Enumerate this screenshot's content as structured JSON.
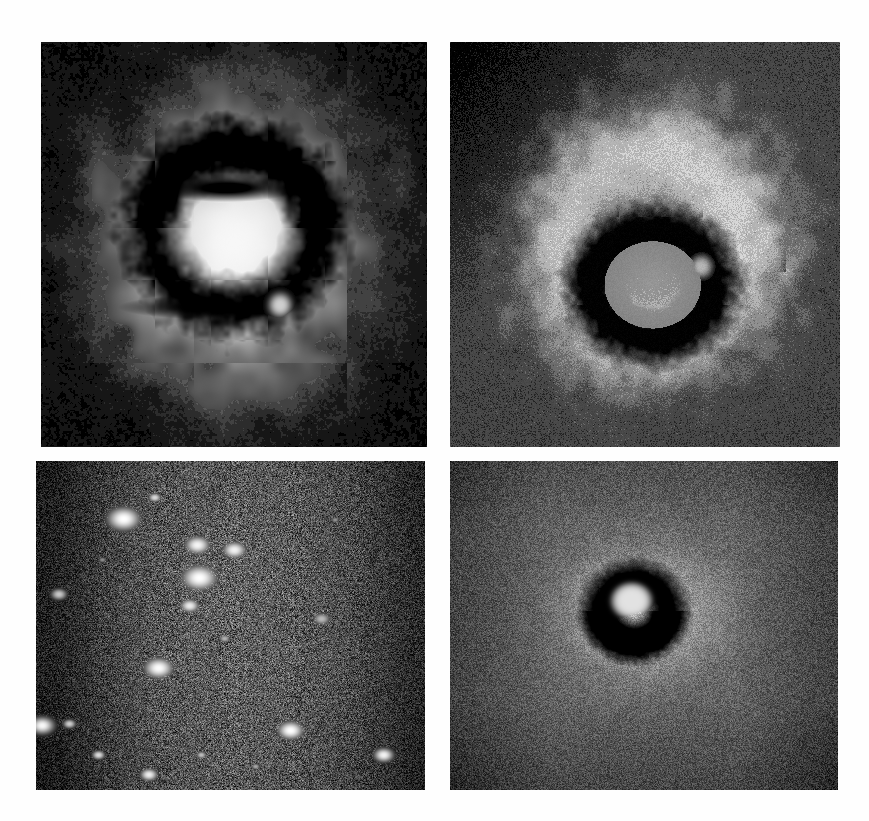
{
  "figure": {
    "kind": "astronomical-image-grid",
    "title": "",
    "background_color": "#fefefe",
    "width": 869,
    "height": 821,
    "columns": 2,
    "rows": 2,
    "has_text_labels": false,
    "has_axes": false,
    "colormap": "grayscale"
  },
  "panels": [
    {
      "id": "panel-top-left",
      "position": "top-left",
      "label": "",
      "x": 41,
      "y": 42,
      "width": 386,
      "height": 405,
      "render": "halo-nebula",
      "background_color": "#060606",
      "description": "Bright diffuse nebular halo with an irregular dark ring/bar structure near the centre and a small bright knot on the lower right of the ring",
      "levels": [
        "#050505",
        "#1d1d1d",
        "#3a3a3a",
        "#5e5e5e",
        "#8a8a8a",
        "#b6b6b6",
        "#d2d2d2"
      ],
      "halo": {
        "cx": 0.5,
        "cy": 0.5,
        "rx": 0.4,
        "ry": 0.4,
        "peak": "#d4d4d4"
      },
      "dark_ring": {
        "cx": 0.5,
        "cy": 0.46,
        "rx": 0.22,
        "ry": 0.2,
        "thickness": 0.055,
        "color": "#040404"
      },
      "inner_bar": {
        "cx": 0.48,
        "cy": 0.36,
        "rx": 0.14,
        "ry": 0.035,
        "color": "#040404"
      },
      "bright_knot": {
        "cx": 0.62,
        "cy": 0.65,
        "r": 0.03,
        "color": "#cfcfcf"
      },
      "noise_amount": 0.035
    },
    {
      "id": "panel-top-right",
      "position": "top-right",
      "label": "",
      "x": 450,
      "y": 42,
      "width": 390,
      "height": 405,
      "render": "contour-nebula",
      "background_color": "#4d4d4d",
      "description": "Posterised / contoured version of the same nebula showing concentric grey intensity bands, a light-grey annular shell, a black inner ring and a noisy speckled background that is darkest toward the upper left",
      "levels": [
        "#0a0a0a",
        "#3c3c3c",
        "#5a5a5a",
        "#7c7c7c",
        "#9e9e9e",
        "#bcbcbc",
        "#d6d6d6"
      ],
      "shell": {
        "cx": 0.52,
        "cy": 0.5,
        "r_outer": 0.37,
        "r_inner": 0.17,
        "color": "#b8b8b8"
      },
      "dark_ring": {
        "cx": 0.52,
        "cy": 0.6,
        "rx": 0.155,
        "ry": 0.135,
        "thickness": 0.05,
        "color": "#060606"
      },
      "bright_knot": {
        "cx": 0.645,
        "cy": 0.555,
        "r": 0.028,
        "color": "#b4b4b4"
      },
      "noise_amount": 0.3,
      "posterize_levels": 6
    },
    {
      "id": "panel-bottom-left",
      "position": "bottom-left",
      "label": "",
      "x": 36,
      "y": 461,
      "width": 389,
      "height": 329,
      "render": "star-field",
      "background_color": "#101010",
      "description": "Crowded star field; speckled dark background brightening toward the centre-right with numerous bright white point sources",
      "levels": [
        "#050505",
        "#1a1a1a",
        "#2e2e2e",
        "#4a4a4a",
        "#6a6a6a",
        "#f2f2f2"
      ],
      "noise_amount": 0.85,
      "stars": [
        {
          "cx": 0.225,
          "cy": 0.175,
          "r": 0.042,
          "brightness": 1.0
        },
        {
          "cx": 0.415,
          "cy": 0.255,
          "r": 0.032,
          "brightness": 0.96
        },
        {
          "cx": 0.51,
          "cy": 0.27,
          "r": 0.03,
          "brightness": 0.95
        },
        {
          "cx": 0.305,
          "cy": 0.11,
          "r": 0.016,
          "brightness": 0.85
        },
        {
          "cx": 0.42,
          "cy": 0.355,
          "r": 0.045,
          "brightness": 1.0
        },
        {
          "cx": 0.395,
          "cy": 0.44,
          "r": 0.024,
          "brightness": 0.92
        },
        {
          "cx": 0.735,
          "cy": 0.48,
          "r": 0.022,
          "brightness": 0.72
        },
        {
          "cx": 0.315,
          "cy": 0.63,
          "r": 0.037,
          "brightness": 0.99
        },
        {
          "cx": 0.485,
          "cy": 0.54,
          "r": 0.014,
          "brightness": 0.7
        },
        {
          "cx": 0.058,
          "cy": 0.405,
          "r": 0.02,
          "brightness": 0.78
        },
        {
          "cx": 0.015,
          "cy": 0.805,
          "r": 0.03,
          "brightness": 0.97
        },
        {
          "cx": 0.085,
          "cy": 0.8,
          "r": 0.016,
          "brightness": 0.8
        },
        {
          "cx": 0.655,
          "cy": 0.82,
          "r": 0.033,
          "brightness": 1.0
        },
        {
          "cx": 0.895,
          "cy": 0.895,
          "r": 0.025,
          "brightness": 0.95
        },
        {
          "cx": 0.16,
          "cy": 0.895,
          "r": 0.016,
          "brightness": 0.86
        },
        {
          "cx": 0.29,
          "cy": 0.955,
          "r": 0.022,
          "brightness": 0.93
        },
        {
          "cx": 0.425,
          "cy": 0.895,
          "r": 0.013,
          "brightness": 0.74
        },
        {
          "cx": 0.565,
          "cy": 0.93,
          "r": 0.011,
          "brightness": 0.66
        },
        {
          "cx": 0.77,
          "cy": 0.178,
          "r": 0.01,
          "brightness": 0.58
        },
        {
          "cx": 0.17,
          "cy": 0.3,
          "r": 0.01,
          "brightness": 0.55
        }
      ]
    },
    {
      "id": "panel-bottom-right",
      "position": "bottom-right",
      "label": "",
      "x": 450,
      "y": 461,
      "width": 388,
      "height": 329,
      "render": "ring-nebula",
      "background_color": "#5a5a5a",
      "description": "Small compact nebula: a black annulus with a bright white core, surrounded by a soft light-grey halo on a strongly speckled medium-grey background that darkens toward the edges",
      "levels": [
        "#090909",
        "#333333",
        "#555555",
        "#767676",
        "#9a9a9a",
        "#c4c4c4",
        "#e6e6e6"
      ],
      "halo": {
        "cx": 0.5,
        "cy": 0.46,
        "rx": 0.2,
        "ry": 0.19,
        "color": "#a6a6a6"
      },
      "dark_ring": {
        "cx": 0.475,
        "cy": 0.455,
        "rx": 0.085,
        "ry": 0.095,
        "thickness": 0.04,
        "color": "#070707"
      },
      "core": {
        "cx": 0.468,
        "cy": 0.425,
        "r": 0.052,
        "color": "#e2e2e2"
      },
      "noise_amount": 0.55
    }
  ]
}
